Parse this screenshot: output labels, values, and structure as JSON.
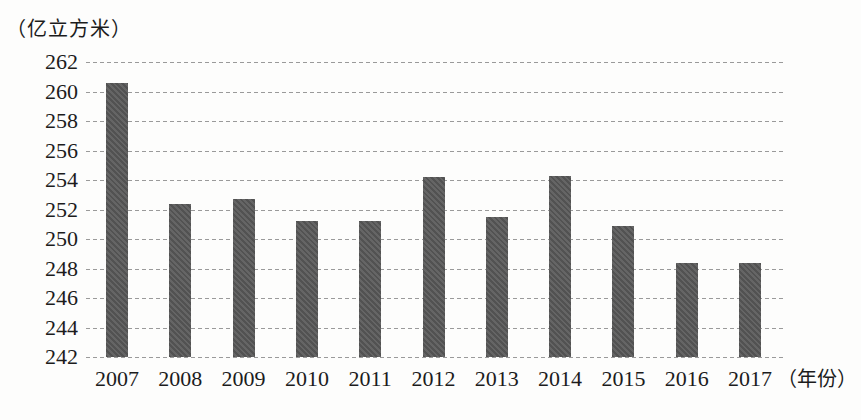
{
  "chart_data": {
    "type": "bar",
    "title": "",
    "unit_label": "（亿立方米）",
    "xaxis_suffix": "（年份）",
    "categories": [
      "2007",
      "2008",
      "2009",
      "2010",
      "2011",
      "2012",
      "2013",
      "2014",
      "2015",
      "2016",
      "2017"
    ],
    "values": [
      260.6,
      252.4,
      252.7,
      251.2,
      251.2,
      254.2,
      251.5,
      254.3,
      250.9,
      248.4,
      248.4
    ],
    "ylabel": "亿立方米",
    "xlabel": "年份",
    "ylim": [
      242,
      262
    ],
    "yticks": [
      242,
      244,
      246,
      248,
      250,
      252,
      254,
      256,
      258,
      260,
      262
    ],
    "grid": "horizontal-dashed",
    "legend": "none",
    "bar_color": "#5a5a5a",
    "gridline_color": "#9a9a9a",
    "text_color": "#1c1c1c",
    "background_color": "#fdfdfc"
  }
}
